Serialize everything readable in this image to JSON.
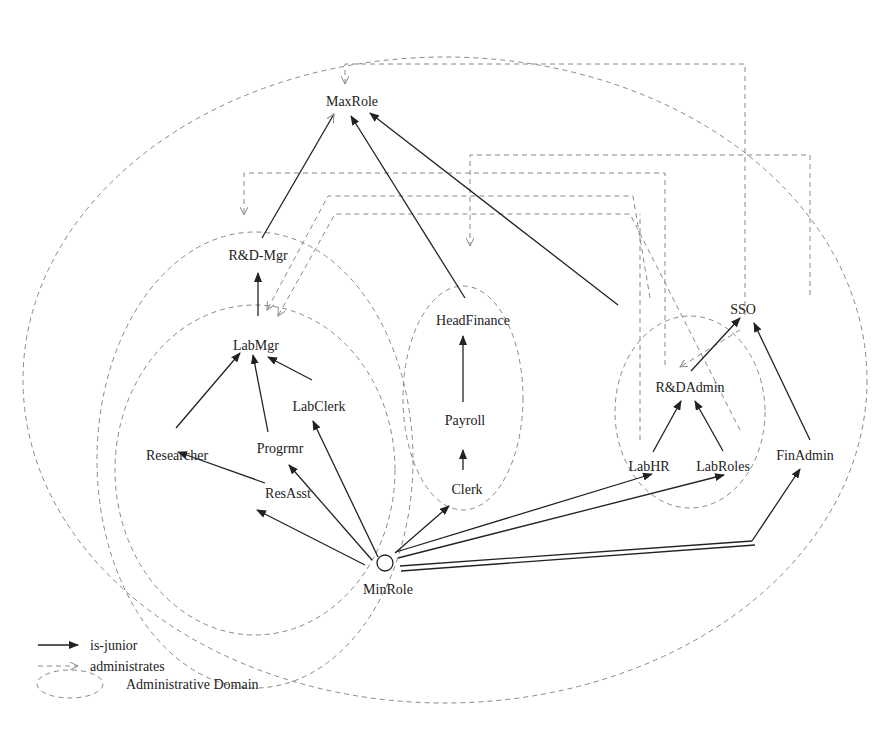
{
  "diagram": {
    "roles": {
      "maxrole": "MaxRole",
      "rdmgr": "R&D-Mgr",
      "labmgr": "LabMgr",
      "labclerk": "LabClerk",
      "researcher": "Researcher",
      "progrmr": "Progrmr",
      "resasst": "ResAsst",
      "minrole": "MinRole",
      "headfinance": "HeadFinance",
      "payroll": "Payroll",
      "clerk": "Clerk",
      "sso": "SSO",
      "rdadmin": "R&DAdmin",
      "labhr": "LabHR",
      "labroles": "LabRoles",
      "finadmin": "FinAdmin"
    },
    "is_junior_edges": [
      [
        "R&D-Mgr",
        "MaxRole"
      ],
      [
        "HeadFinance",
        "MaxRole"
      ],
      [
        "SSO",
        "MaxRole"
      ],
      [
        "LabMgr",
        "R&D-Mgr"
      ],
      [
        "Researcher",
        "LabMgr"
      ],
      [
        "Progrmr",
        "LabMgr"
      ],
      [
        "LabClerk",
        "LabMgr"
      ],
      [
        "ResAsst",
        "Researcher"
      ],
      [
        "MinRole",
        "ResAsst"
      ],
      [
        "MinRole",
        "Progrmr"
      ],
      [
        "MinRole",
        "LabClerk"
      ],
      [
        "Payroll",
        "HeadFinance"
      ],
      [
        "Clerk",
        "Payroll"
      ],
      [
        "MinRole",
        "Clerk"
      ],
      [
        "R&DAdmin",
        "SSO"
      ],
      [
        "FinAdmin",
        "SSO"
      ],
      [
        "LabHR",
        "R&DAdmin"
      ],
      [
        "LabRoles",
        "R&DAdmin"
      ],
      [
        "MinRole",
        "LabHR"
      ],
      [
        "MinRole",
        "LabRoles"
      ],
      [
        "MinRole",
        "FinAdmin"
      ]
    ],
    "legend": {
      "is_junior": "is-junior",
      "administrates": "administrates",
      "domain": "Administrative Domain"
    }
  }
}
